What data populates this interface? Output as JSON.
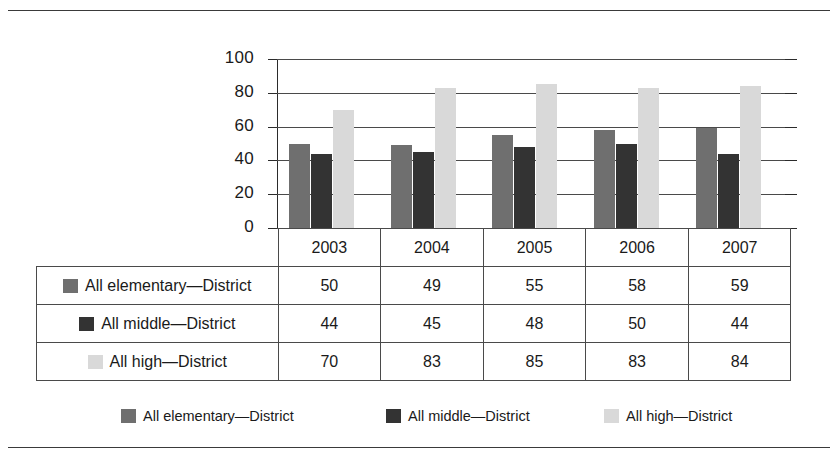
{
  "chart_data": {
    "type": "bar",
    "title": "",
    "subtitle": "",
    "xlabel": "",
    "ylabel": "",
    "categories": [
      "2003",
      "2004",
      "2005",
      "2006",
      "2007"
    ],
    "series": [
      {
        "name": "All elementary—District",
        "color": "#6f6f6f",
        "values": [
          50,
          49,
          55,
          58,
          59
        ]
      },
      {
        "name": "All middle—District",
        "color": "#333333",
        "values": [
          44,
          45,
          48,
          50,
          44
        ]
      },
      {
        "name": "All high—District",
        "color": "#d9d9d9",
        "values": [
          70,
          83,
          85,
          83,
          84
        ]
      }
    ],
    "ylim": [
      0,
      100
    ],
    "yticks": [
      0,
      20,
      40,
      60,
      80,
      100
    ],
    "ytick_labels": [
      "0",
      "20",
      "40",
      "60",
      "80",
      "100"
    ],
    "grid": true,
    "legend_position": "bottom",
    "data_table_shown": true
  },
  "legend": {
    "items": [
      {
        "label": "All elementary—District",
        "swatch": "s0"
      },
      {
        "label": "All middle—District",
        "swatch": "s1"
      },
      {
        "label": "All high—District",
        "swatch": "s2"
      }
    ]
  },
  "table": {
    "header": [
      "",
      "2003",
      "2004",
      "2005",
      "2006",
      "2007"
    ],
    "rows": [
      {
        "label": "All elementary—District",
        "swatch": "s0",
        "values": [
          "50",
          "49",
          "55",
          "58",
          "59"
        ]
      },
      {
        "label": "All middle—District",
        "swatch": "s1",
        "values": [
          "44",
          "45",
          "48",
          "50",
          "44"
        ]
      },
      {
        "label": "All high—District",
        "swatch": "s2",
        "values": [
          "70",
          "83",
          "85",
          "83",
          "84"
        ]
      }
    ]
  }
}
